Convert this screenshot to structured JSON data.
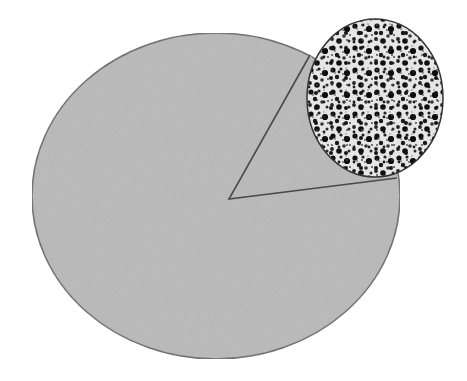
{
  "diagram": {
    "main_body": {
      "shape": "ellipse",
      "cx": 216,
      "cy": 196,
      "rx": 184,
      "ry": 163,
      "fill": "#b9b9b9",
      "stroke": "#6a6a6a"
    },
    "wedge": {
      "apex": [
        229,
        199
      ],
      "p1": [
        310,
        55
      ],
      "p2": [
        397,
        178
      ],
      "fill": "#b9b9b9",
      "stroke": "#4a4a4a"
    },
    "magnified_inset": {
      "shape": "ellipse",
      "cx": 375,
      "cy": 98,
      "rx": 68,
      "ry": 79,
      "background": "#e8e8e8",
      "dot_color": "#111111",
      "stroke": "#333333"
    }
  }
}
